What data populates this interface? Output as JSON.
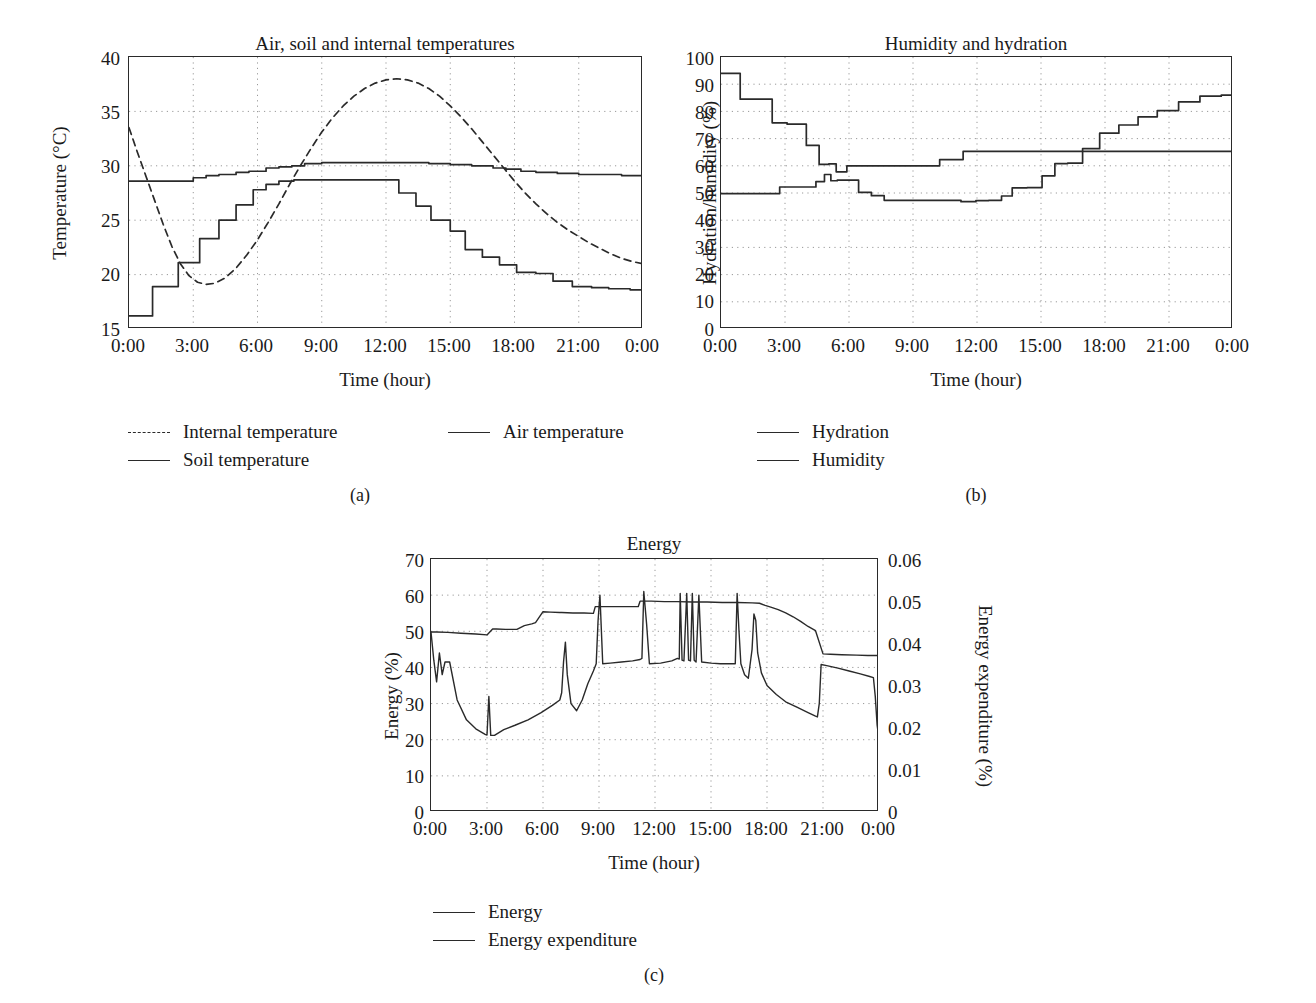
{
  "figure": {
    "panels": [
      {
        "id": "a",
        "caption": "(a)",
        "title": "Air, soil and internal temperatures",
        "xlabel": "Time (hour)",
        "ylabel": "Temperature (°C)",
        "yticks": [
          "15",
          "20",
          "25",
          "30",
          "35",
          "40"
        ],
        "xticks": [
          "0:00",
          "3:00",
          "6:00",
          "9:00",
          "12:00",
          "15:00",
          "18:00",
          "21:00",
          "0:00"
        ],
        "legend": [
          {
            "label": "Internal temperature",
            "style": "dashed"
          },
          {
            "label": "Air temperature",
            "style": "solid"
          },
          {
            "label": "Soil temperature",
            "style": "solid"
          }
        ]
      },
      {
        "id": "b",
        "caption": "(b)",
        "title": "Humidity and hydration",
        "xlabel": "Time (hour)",
        "ylabel": "Hydration/humidity (%)",
        "yticks": [
          "0",
          "10",
          "20",
          "30",
          "40",
          "50",
          "60",
          "70",
          "80",
          "90",
          "100"
        ],
        "xticks": [
          "0:00",
          "3:00",
          "6:00",
          "9:00",
          "12:00",
          "15:00",
          "18:00",
          "21:00",
          "0:00"
        ],
        "legend": [
          {
            "label": "Hydration",
            "style": "solid"
          },
          {
            "label": "Humidity",
            "style": "solid"
          }
        ]
      },
      {
        "id": "c",
        "caption": "(c)",
        "title": "Energy",
        "xlabel": "Time (hour)",
        "ylabel": "Energy (%)",
        "ylabel_right": "Energy expenditure (%)",
        "yticks": [
          "0",
          "10",
          "20",
          "30",
          "40",
          "50",
          "60",
          "70"
        ],
        "yticks_right": [
          "0",
          "0.01",
          "0.02",
          "0.03",
          "0.04",
          "0.05",
          "0.06"
        ],
        "xticks": [
          "0:00",
          "3:00",
          "6:00",
          "9:00",
          "12:00",
          "15:00",
          "18:00",
          "21:00",
          "0:00"
        ],
        "legend": [
          {
            "label": "Energy",
            "style": "solid"
          },
          {
            "label": "Energy expenditure",
            "style": "solid"
          }
        ]
      }
    ]
  },
  "chart_data": [
    {
      "type": "line",
      "panel": "a",
      "title": "Air, soil and internal temperatures",
      "xlabel": "Time (hour)",
      "ylabel": "Temperature (°C)",
      "xlim": [
        0,
        24
      ],
      "ylim": [
        15,
        40
      ],
      "xtick_values": [
        0,
        3,
        6,
        9,
        12,
        15,
        18,
        21,
        24
      ],
      "xtick_labels": [
        "0:00",
        "3:00",
        "6:00",
        "9:00",
        "12:00",
        "15:00",
        "18:00",
        "21:00",
        "0:00"
      ],
      "ytick_values": [
        15,
        20,
        25,
        30,
        35,
        40
      ],
      "grid": true,
      "legend_position": "below",
      "series": [
        {
          "name": "Internal temperature",
          "style": "dashed",
          "x": [
            0,
            0.4,
            0.8,
            1.2,
            1.6,
            2.0,
            2.4,
            2.8,
            3.2,
            3.6,
            4.0,
            4.5,
            5.0,
            5.5,
            6.0,
            6.5,
            7.0,
            7.5,
            8.0,
            8.5,
            9.0,
            9.5,
            10.0,
            10.5,
            11.0,
            11.5,
            12.0,
            12.5,
            13.0,
            13.5,
            14.0,
            14.5,
            15.0,
            15.5,
            16.0,
            16.5,
            17.0,
            17.5,
            18.0,
            18.5,
            19.0,
            19.5,
            20.0,
            20.5,
            21.0,
            21.5,
            22.0,
            22.5,
            23.0,
            23.5,
            24.0
          ],
          "y": [
            33.5,
            31.2,
            29.0,
            26.8,
            24.6,
            22.6,
            21.0,
            19.9,
            19.3,
            19.1,
            19.2,
            19.7,
            20.6,
            21.8,
            23.2,
            24.8,
            26.5,
            28.3,
            30.0,
            31.6,
            33.1,
            34.4,
            35.5,
            36.4,
            37.1,
            37.6,
            37.9,
            38.0,
            37.9,
            37.6,
            37.1,
            36.4,
            35.5,
            34.5,
            33.4,
            32.2,
            31.0,
            29.8,
            28.6,
            27.5,
            26.5,
            25.6,
            24.8,
            24.1,
            23.5,
            22.9,
            22.4,
            21.9,
            21.5,
            21.2,
            21.0
          ]
        },
        {
          "name": "Air temperature",
          "style": "solid-step",
          "x": [
            0,
            1,
            2,
            3,
            3.6,
            4.2,
            5,
            5.6,
            6.4,
            7,
            7.6,
            8.2,
            9,
            10,
            11,
            12,
            13,
            14,
            15,
            16,
            17,
            17.6,
            18.3,
            19,
            20,
            21,
            22,
            23,
            24
          ],
          "y": [
            28.6,
            28.6,
            28.6,
            28.9,
            29.1,
            29.2,
            29.4,
            29.5,
            29.8,
            29.9,
            30.0,
            30.2,
            30.3,
            30.3,
            30.3,
            30.3,
            30.3,
            30.2,
            30.1,
            30.0,
            29.8,
            29.7,
            29.5,
            29.4,
            29.3,
            29.2,
            29.2,
            29.1,
            29.1
          ]
        },
        {
          "name": "Soil temperature",
          "style": "solid-step",
          "x": [
            0,
            1.0,
            1.1,
            2.2,
            2.3,
            3.2,
            3.3,
            4.1,
            4.2,
            4.9,
            5.0,
            5.7,
            5.8,
            6.3,
            6.4,
            6.9,
            7.0,
            7.6,
            7.7,
            12.5,
            12.6,
            13.3,
            13.4,
            14.0,
            14.1,
            14.9,
            15.0,
            15.6,
            15.7,
            16.4,
            16.5,
            17.2,
            17.3,
            18.0,
            18.1,
            18.9,
            19.0,
            19.7,
            19.8,
            20.6,
            20.7,
            21.5,
            21.6,
            22.3,
            22.4,
            23.3,
            23.4,
            24.0
          ],
          "y": [
            16.2,
            16.2,
            18.9,
            18.9,
            21.1,
            21.1,
            23.3,
            23.3,
            25.0,
            25.0,
            26.4,
            26.4,
            27.8,
            27.8,
            28.3,
            28.3,
            28.6,
            28.6,
            28.7,
            28.7,
            27.5,
            27.5,
            26.3,
            26.3,
            25.0,
            25.0,
            24.0,
            24.0,
            22.3,
            22.3,
            21.6,
            21.6,
            20.9,
            20.9,
            20.2,
            20.2,
            20.1,
            20.1,
            19.4,
            19.4,
            18.9,
            18.9,
            18.8,
            18.8,
            18.7,
            18.7,
            18.6,
            18.6
          ]
        }
      ]
    },
    {
      "type": "line",
      "panel": "b",
      "title": "Humidity and hydration",
      "xlabel": "Time (hour)",
      "ylabel": "Hydration/humidity (%)",
      "xlim": [
        0,
        24
      ],
      "ylim": [
        0,
        100
      ],
      "xtick_values": [
        0,
        3,
        6,
        9,
        12,
        15,
        18,
        21,
        24
      ],
      "xtick_labels": [
        "0:00",
        "3:00",
        "6:00",
        "9:00",
        "12:00",
        "15:00",
        "18:00",
        "21:00",
        "0:00"
      ],
      "ytick_values": [
        0,
        10,
        20,
        30,
        40,
        50,
        60,
        70,
        80,
        90,
        100
      ],
      "grid": true,
      "legend_position": "below",
      "series": [
        {
          "name": "Hydration",
          "style": "solid-step",
          "x": [
            0,
            2.7,
            2.75,
            4.4,
            4.45,
            4.8,
            4.85,
            5.1,
            5.15,
            5.4,
            5.45,
            6.4,
            6.45,
            7.0,
            7.05,
            7.6,
            7.65,
            11.2,
            11.25,
            11.9,
            11.95,
            12.5,
            12.55,
            13.1,
            13.15,
            13.6,
            13.65,
            14.3,
            14.35,
            15.0,
            15.05,
            15.6,
            15.65,
            16.2,
            16.25,
            16.9,
            16.95,
            17.7,
            17.75,
            18.6,
            18.65,
            19.5,
            19.55,
            20.4,
            20.45,
            21.4,
            21.45,
            22.4,
            22.45,
            23.4,
            23.45,
            24
          ],
          "y": [
            49.8,
            49.8,
            52.2,
            52.2,
            54.2,
            54.2,
            56.8,
            56.8,
            54.5,
            54.5,
            54.7,
            54.7,
            50.2,
            50.2,
            49.0,
            49.0,
            47.3,
            47.3,
            46.8,
            46.8,
            47.2,
            47.2,
            47.3,
            47.3,
            48.9,
            48.9,
            51.9,
            51.9,
            52.0,
            52.0,
            56.3,
            56.3,
            60.8,
            60.8,
            61.0,
            61.0,
            66.3,
            66.3,
            72.0,
            72.0,
            75.0,
            75.0,
            78.0,
            78.0,
            80.3,
            80.3,
            83.5,
            83.5,
            85.6,
            85.6,
            86.0,
            88.5
          ]
        },
        {
          "name": "Humidity",
          "style": "solid-step",
          "x": [
            0,
            0.85,
            0.9,
            2.35,
            2.4,
            3.05,
            3.1,
            3.95,
            4.0,
            4.55,
            4.6,
            5.0,
            5.05,
            5.35,
            5.4,
            5.85,
            5.9,
            8.6,
            8.65,
            10.2,
            10.25,
            11.3,
            11.35,
            24
          ],
          "y": [
            94.0,
            94.0,
            84.5,
            84.5,
            75.8,
            75.8,
            75.3,
            75.3,
            67.5,
            67.5,
            60.5,
            60.5,
            60.7,
            60.7,
            57.8,
            57.8,
            60.0,
            60.0,
            60.0,
            60.0,
            62.3,
            62.3,
            65.3,
            65.3
          ]
        }
      ]
    },
    {
      "type": "line",
      "panel": "c",
      "title": "Energy",
      "xlabel": "Time (hour)",
      "ylabel": "Energy (%)",
      "ylabel_right": "Energy expenditure (%)",
      "xlim": [
        0,
        24
      ],
      "ylim": [
        0,
        70
      ],
      "ylim_right": [
        0,
        0.06
      ],
      "xtick_values": [
        0,
        3,
        6,
        9,
        12,
        15,
        18,
        21,
        24
      ],
      "xtick_labels": [
        "0:00",
        "3:00",
        "6:00",
        "9:00",
        "12:00",
        "15:00",
        "18:00",
        "21:00",
        "0:00"
      ],
      "ytick_values": [
        0,
        10,
        20,
        30,
        40,
        50,
        60,
        70
      ],
      "ytick_values_right": [
        0,
        0.01,
        0.02,
        0.03,
        0.04,
        0.05,
        0.06
      ],
      "grid": true,
      "legend_position": "below",
      "series": [
        {
          "name": "Energy",
          "axis": "left",
          "style": "solid",
          "x": [
            0,
            0.15,
            0.3,
            0.45,
            0.6,
            0.75,
            1.0,
            1.4,
            1.9,
            2.4,
            2.9,
            3.0,
            3.1,
            3.2,
            3.4,
            3.9,
            4.5,
            5.2,
            5.9,
            6.5,
            6.9,
            7.0,
            7.1,
            7.2,
            7.3,
            7.5,
            7.8,
            8.1,
            8.4,
            8.7,
            8.85,
            8.95,
            9.05,
            9.2,
            9.6,
            10.2,
            10.8,
            11.2,
            11.3,
            11.4,
            11.55,
            11.7,
            12.3,
            12.9,
            13.2,
            13.3,
            13.35,
            13.45,
            13.55,
            13.7,
            13.8,
            13.9,
            14.0,
            14.1,
            14.2,
            14.35,
            14.5,
            15.0,
            15.5,
            16.0,
            16.3,
            16.4,
            16.5,
            16.6,
            16.8,
            17.0,
            17.2,
            17.3,
            17.4,
            17.5,
            17.7,
            18.0,
            18.5,
            19.0,
            19.6,
            20.2,
            20.6,
            20.7,
            20.8,
            20.9,
            21.2,
            21.8,
            22.4,
            23.0,
            23.5,
            23.7,
            23.8,
            23.9,
            24.0
          ],
          "y": [
            49.8,
            42.0,
            36.0,
            44.0,
            38.0,
            41.5,
            41.5,
            31.0,
            25.5,
            23.0,
            21.5,
            21.3,
            32.0,
            21.2,
            21.2,
            22.8,
            24.0,
            25.5,
            27.5,
            29.5,
            31.0,
            33.0,
            41.5,
            47.0,
            38.0,
            30.0,
            28.0,
            31.0,
            35.5,
            39.0,
            41.0,
            53.0,
            60.0,
            41.0,
            41.2,
            41.5,
            41.8,
            42.2,
            42.5,
            61.0,
            52.0,
            41.0,
            41.2,
            41.8,
            42.5,
            42.3,
            60.5,
            42.0,
            41.8,
            60.5,
            42.0,
            41.8,
            60.5,
            42.0,
            41.5,
            60.0,
            41.5,
            41.2,
            41.0,
            41.0,
            41.0,
            60.5,
            50.0,
            41.0,
            38.0,
            37.0,
            45.0,
            54.8,
            53.0,
            44.0,
            38.5,
            35.0,
            32.5,
            30.5,
            29.0,
            27.5,
            26.5,
            26.3,
            30.0,
            40.8,
            40.5,
            39.8,
            39.0,
            38.2,
            37.5,
            37.2,
            32.0,
            24.0,
            20.5
          ]
        },
        {
          "name": "Energy expenditure",
          "axis": "right",
          "style": "solid",
          "x": [
            0,
            0.3,
            0.9,
            1.6,
            2.4,
            3.0,
            3.3,
            3.5,
            4.0,
            4.6,
            5.0,
            5.4,
            5.6,
            6.0,
            6.4,
            6.9,
            7.0,
            7.6,
            8.2,
            8.7,
            8.8,
            9.4,
            10.0,
            10.6,
            11.1,
            11.2,
            11.8,
            12.5,
            13.2,
            14.0,
            14.8,
            15.6,
            16.4,
            17.2,
            17.6,
            17.9,
            18.2,
            18.6,
            19.0,
            19.4,
            19.8,
            20.2,
            20.6,
            21.0,
            21.4,
            22.0,
            22.8,
            23.4,
            24.0
          ],
          "y": [
            0.0427,
            0.0427,
            0.0426,
            0.0424,
            0.0422,
            0.042,
            0.0434,
            0.0434,
            0.0433,
            0.0433,
            0.0442,
            0.0446,
            0.0449,
            0.0475,
            0.0474,
            0.0473,
            0.0473,
            0.0472,
            0.0472,
            0.0471,
            0.0487,
            0.0487,
            0.0487,
            0.0487,
            0.0487,
            0.05,
            0.05,
            0.0499,
            0.0499,
            0.0498,
            0.0498,
            0.0497,
            0.0497,
            0.0496,
            0.0495,
            0.049,
            0.0486,
            0.048,
            0.0472,
            0.0463,
            0.0452,
            0.044,
            0.043,
            0.0375,
            0.0374,
            0.0373,
            0.0372,
            0.0371,
            0.0371
          ]
        }
      ]
    }
  ]
}
